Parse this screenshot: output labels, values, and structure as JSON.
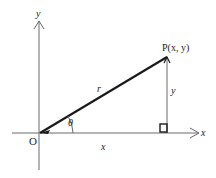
{
  "diagram": {
    "colors": {
      "axis": "#6a6a6a",
      "radius": "#1a1a1a",
      "text": "#222222",
      "background": "#ffffff"
    },
    "axes": {
      "x_label": "x",
      "y_label": "y",
      "origin_label": "O"
    },
    "point": {
      "label": "P(x, y)"
    },
    "segments": {
      "radius_label": "r",
      "horizontal_label": "x",
      "vertical_label": "y",
      "angle_label": "θ"
    },
    "right_angle_marker": true
  }
}
